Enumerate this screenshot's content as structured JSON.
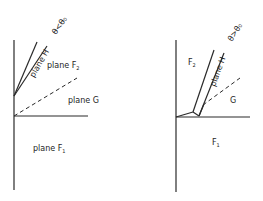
{
  "figure_left": {
    "plane_h_label": "plane H",
    "condition_label": "θ<θ₀",
    "f2_label": "plane F",
    "f2_sub": "2",
    "g_label": "plane G",
    "f1_label": "plane F",
    "f1_sub": "1"
  },
  "figure_right": {
    "plane_h_label": "plane H",
    "condition_label": "θ>θ₀",
    "f2_label": "F",
    "f2_sub": "2",
    "g_label": "G",
    "f1_label": "F",
    "f1_sub": "1"
  },
  "colors": {
    "line": "#2a2a2a",
    "text": "#1e1e1e",
    "background": "#ffffff"
  }
}
